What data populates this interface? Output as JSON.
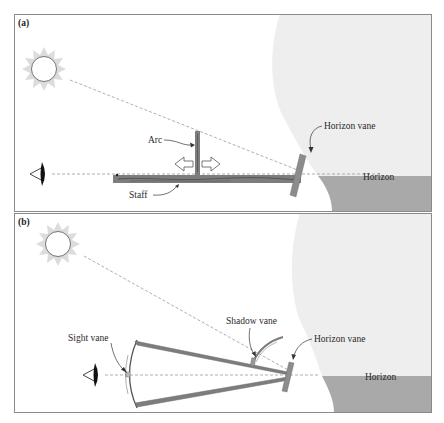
{
  "figure": {
    "panels": [
      {
        "id": "a",
        "label": "(a)",
        "instrument": "back-staff (cross-staff variant)",
        "labels": {
          "arc": "Arc",
          "staff": "Staff",
          "horizon_vane": "Horizon vane",
          "horizon": "Horizon"
        }
      },
      {
        "id": "b",
        "label": "(b)",
        "instrument": "Davis quadrant",
        "labels": {
          "sight_vane": "Sight vane",
          "shadow_vane": "Shadow vane",
          "horizon_vane": "Horizon vane",
          "horizon": "Horizon"
        }
      }
    ]
  },
  "colors": {
    "border": "#8a8a8a",
    "sky": "#eeeeee",
    "sea": "#a9a9a9",
    "sun_rays": "#dcdcdc",
    "wood": "#7d7d7d",
    "wood_dark": "#4a4a4a",
    "vane": "#8c8c8c",
    "dashed_line": "#9a9a9a"
  }
}
